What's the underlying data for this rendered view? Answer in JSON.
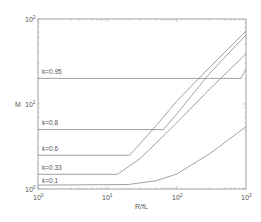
{
  "chart_data": {
    "type": "line",
    "title": "",
    "xlabel": "R/fL",
    "ylabel": "M",
    "xscale": "log",
    "yscale": "log",
    "xlim": [
      1,
      1000
    ],
    "ylim": [
      1,
      100
    ],
    "grid": false,
    "legend": "inline labels",
    "x_tick_labels": [
      "10^0",
      "10^1",
      "10^2",
      "10^3"
    ],
    "y_tick_labels": [
      "10^0",
      "10^1",
      "10^2"
    ],
    "series": [
      {
        "name": "k=0.95",
        "points": [
          [
            1,
            20
          ],
          [
            850,
            20
          ],
          [
            1000,
            26
          ]
        ]
      },
      {
        "name": "k=0.8",
        "points": [
          [
            1,
            5
          ],
          [
            64,
            5
          ],
          [
            100,
            7.6
          ],
          [
            300,
            23
          ],
          [
            1000,
            65
          ]
        ]
      },
      {
        "name": "k=0.6",
        "points": [
          [
            1,
            2.5
          ],
          [
            21,
            2.5
          ],
          [
            50,
            5.5
          ],
          [
            100,
            10.8
          ],
          [
            300,
            27
          ],
          [
            1000,
            72
          ]
        ]
      },
      {
        "name": "k=0.33",
        "points": [
          [
            1,
            1.49
          ],
          [
            14,
            1.49
          ],
          [
            30,
            2.3
          ],
          [
            100,
            6
          ],
          [
            300,
            15
          ],
          [
            1000,
            39
          ]
        ]
      },
      {
        "name": "k=0.1",
        "points": [
          [
            1,
            1.11
          ],
          [
            20,
            1.13
          ],
          [
            50,
            1.25
          ],
          [
            100,
            1.5
          ],
          [
            300,
            2.6
          ],
          [
            1000,
            5.4
          ]
        ]
      }
    ]
  },
  "labels": {
    "xlabel": "R/fL",
    "ylabel": "M",
    "xticks": [
      {
        "base": "10",
        "exp": "0"
      },
      {
        "base": "10",
        "exp": "1"
      },
      {
        "base": "10",
        "exp": "2"
      },
      {
        "base": "10",
        "exp": "3"
      }
    ],
    "yticks": [
      {
        "base": "10",
        "exp": "0"
      },
      {
        "base": "10",
        "exp": "1"
      },
      {
        "base": "10",
        "exp": "2"
      }
    ],
    "curves": [
      "k=0.95",
      "k=0.8",
      "k=0.6",
      "k=0.33",
      "k=0.1"
    ]
  },
  "colors": {
    "axis": "#8a8a8a",
    "line": "#7a7a7a",
    "text": "#555555",
    "background": "#ffffff"
  }
}
